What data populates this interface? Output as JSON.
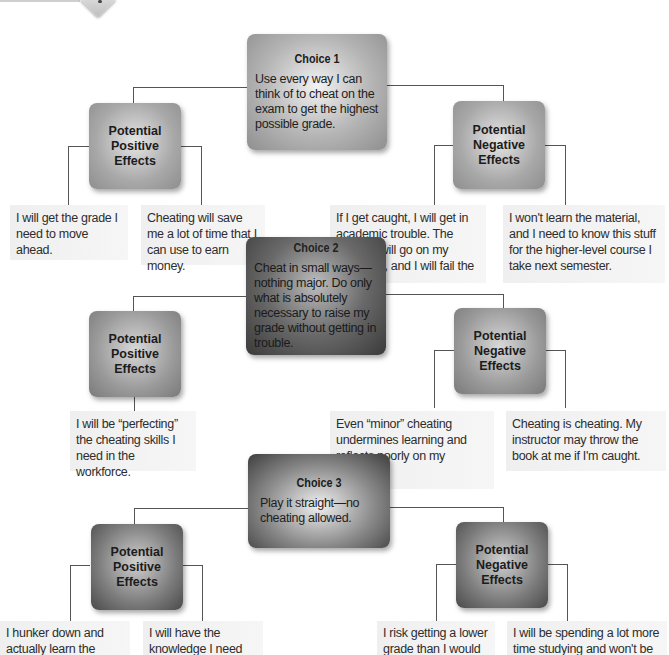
{
  "decoration": {
    "icon": "diamond-tab-icon"
  },
  "choices": [
    {
      "title": "Choice 1",
      "description": "Use every way I can think of to cheat on the exam to get the highest possible grade.",
      "positive": {
        "label": "Potential Positive Effects",
        "label_lines": [
          "Potential",
          "Positive",
          "Effects"
        ],
        "items": [
          "I will get the grade I need to move ahead.",
          "Cheating will save me a lot of time that I can use to earn money."
        ]
      },
      "negative": {
        "label": "Potential Negative Effects",
        "label_lines": [
          "Potential",
          "Negative",
          "Effects"
        ],
        "items": [
          "If I get caught, I will get in academic trouble. The incident will go on my transcript, and I will fail the course.",
          "I won't learn the material, and I need to know this stuff for the higher-level course I take next semester."
        ]
      }
    },
    {
      "title": "Choice 2",
      "description": "Cheat in small ways—nothing major. Do only what is absolutely necessary to raise my grade without getting in trouble.",
      "positive": {
        "label": "Potential Positive Effects",
        "label_lines": [
          "Potential",
          "Positive",
          "Effects"
        ],
        "items": [
          "I will be “perfecting” the cheating skills I need in the workforce."
        ]
      },
      "negative": {
        "label": "Potential Negative Effects",
        "label_lines": [
          "Potential",
          "Negative",
          "Effects"
        ],
        "items": [
          "Even “minor” cheating undermines learning and reflects poorly on my character.",
          "Cheating is cheating. My instructor may throw the book at me if I'm caught."
        ]
      }
    },
    {
      "title": "Choice 3",
      "description": "Play it straight—no cheating allowed.",
      "positive": {
        "label": "Potential Positive Effects",
        "label_lines": [
          "Potential",
          "Positive",
          "Effects"
        ],
        "items": [
          "I hunker down and actually learn the material so that I come into the test fully prepared.",
          "I will have the knowledge I need for courses and for the workplace."
        ]
      },
      "negative": {
        "label": "Potential Negative Effects",
        "label_lines": [
          "Potential",
          "Negative",
          "Effects"
        ],
        "items": [
          "I risk getting a lower grade than I would if I cheated.",
          "I will be spending a lot more time studying and won't be able to work as many hours on my job."
        ]
      }
    }
  ]
}
